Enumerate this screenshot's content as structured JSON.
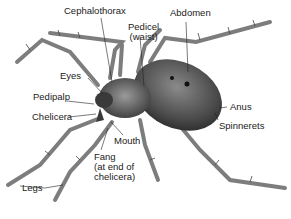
{
  "diagram": {
    "labels": {
      "cephalothorax": "Cephalothorax",
      "pedicel_line1": "Pedicel",
      "pedicel_line2": "(waist)",
      "abdomen": "Abdomen",
      "eyes": "Eyes",
      "pedipalp": "Pedipalp",
      "chelicera": "Chelicera",
      "mouth": "Mouth",
      "fang_line1": "Fang",
      "fang_line2": "(at end of",
      "fang_line3": "chelicera)",
      "legs": "Legs",
      "anus": "Anus",
      "spinnerets": "Spinnerets"
    },
    "colors": {
      "ink": "#222222",
      "body_dark": "#3a3a3a",
      "body_mid": "#6b6b6b",
      "leg": "#8a8a8a",
      "background": "#ffffff"
    }
  }
}
